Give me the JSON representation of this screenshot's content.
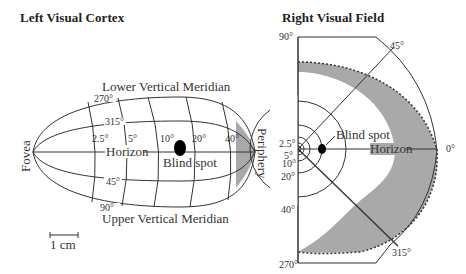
{
  "left_panel": {
    "title": "Left Visual Cortex",
    "top_label": "Lower Vertical Meridian",
    "bottom_label": "Upper Vertical Meridian",
    "left_label": "Fovea",
    "right_label": "Periphery",
    "horizon_label": "Horizon",
    "blind_spot_label": "Blind spot",
    "eccentricity_ticks": [
      "2.5°",
      "5°",
      "10°",
      "20°",
      "40°"
    ],
    "angle_ticks": [
      "270°",
      "315°",
      "45°",
      "90°"
    ],
    "scale_bar_label": "1 cm"
  },
  "right_panel": {
    "title": "Right Visual Field",
    "horizon_label": "Horizon",
    "blind_spot_label": "Blind spot",
    "angle_ticks": [
      "90°",
      "45°",
      "0°",
      "315°",
      "270°"
    ],
    "eccentricity_ticks": [
      "2.5°",
      "5°",
      "10°",
      "20°",
      "40°"
    ]
  },
  "colors": {
    "shade": "#a9a9a9",
    "line": "#333333",
    "spot": "#000000"
  }
}
